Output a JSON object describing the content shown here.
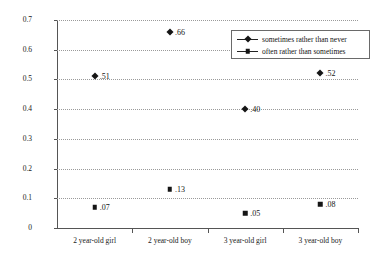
{
  "chart_data": {
    "type": "scatter",
    "title": "",
    "subtitle": "",
    "xlabel": "",
    "ylabel": "Odds",
    "categories": [
      "2 year-old girl",
      "2 year-old boy",
      "3 year-old girl",
      "3 year-old boy"
    ],
    "ylim": [
      0,
      0.7
    ],
    "ytick_labels": [
      "0",
      "0.1",
      "0.2",
      "0.3",
      "0.4",
      "0.5",
      "0.6",
      "0.7"
    ],
    "ytick_values": [
      0,
      0.1,
      0.2,
      0.3,
      0.4,
      0.5,
      0.6,
      0.7
    ],
    "grid": true,
    "grid_style": "dotted-horizontal",
    "legend_position": "top-right",
    "series": [
      {
        "name": "sometimes rather than never",
        "marker": "diamond",
        "values": [
          0.51,
          0.66,
          0.4,
          0.52
        ],
        "data_labels": [
          ".51",
          ".66",
          ".40",
          ".52"
        ]
      },
      {
        "name": "often rather than sometimes",
        "marker": "square",
        "values": [
          0.07,
          0.13,
          0.05,
          0.08
        ],
        "data_labels": [
          ".07",
          ".13",
          ".05",
          ".08"
        ]
      }
    ]
  },
  "colors": {
    "marker": "#151515",
    "axis": "#555555",
    "grid": "#9a9a9a",
    "text": "#1a1a1a",
    "background": "#ffffff"
  }
}
